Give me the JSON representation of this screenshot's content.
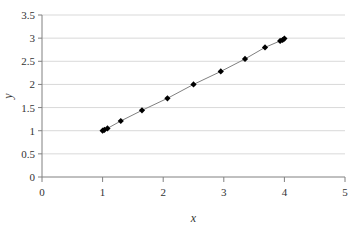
{
  "chart_data": {
    "type": "scatter",
    "title": "",
    "subtitle": "",
    "xlabel": "x",
    "ylabel": "y",
    "xlim": [
      0,
      5
    ],
    "ylim": [
      0,
      3.5
    ],
    "xticks": [
      "0",
      "1",
      "2",
      "3",
      "4",
      "5"
    ],
    "xtick_values": [
      0,
      1,
      2,
      3,
      4,
      5
    ],
    "yticks": [
      "0",
      "0.5",
      "1",
      "1.5",
      "2",
      "2.5",
      "3",
      "3.5"
    ],
    "ytick_values": [
      0,
      0.5,
      1,
      1.5,
      2,
      2.5,
      3,
      3.5
    ],
    "grid": "horizontal",
    "grid_color": "#d9d9d9",
    "axis_color": "#808080",
    "legend": "none",
    "marker": "diamond",
    "marker_color": "#000000",
    "line_color": "#808080",
    "connected": true,
    "x": [
      1.0,
      1.03,
      1.08,
      1.3,
      1.65,
      2.07,
      2.5,
      2.95,
      3.35,
      3.68,
      3.93,
      3.97,
      4.0
    ],
    "y": [
      1.0,
      1.02,
      1.05,
      1.21,
      1.44,
      1.7,
      2.0,
      2.28,
      2.55,
      2.8,
      2.94,
      2.96,
      2.99
    ],
    "points": [
      {
        "x": 1.0,
        "y": 1.0
      },
      {
        "x": 1.03,
        "y": 1.02
      },
      {
        "x": 1.08,
        "y": 1.05
      },
      {
        "x": 1.3,
        "y": 1.21
      },
      {
        "x": 1.65,
        "y": 1.44
      },
      {
        "x": 2.07,
        "y": 1.7
      },
      {
        "x": 2.5,
        "y": 2.0
      },
      {
        "x": 2.95,
        "y": 2.28
      },
      {
        "x": 3.35,
        "y": 2.55
      },
      {
        "x": 3.68,
        "y": 2.8
      },
      {
        "x": 3.93,
        "y": 2.94
      },
      {
        "x": 3.97,
        "y": 2.96
      },
      {
        "x": 4.0,
        "y": 2.99
      }
    ]
  }
}
